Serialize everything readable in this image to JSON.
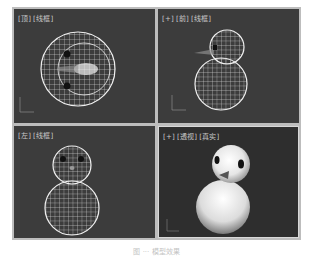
{
  "viewports": [
    {
      "id": "top",
      "labels": [
        "[顶]",
        "[线框]"
      ],
      "shading": "wireframe"
    },
    {
      "id": "front",
      "labels": [
        "[+]",
        "[前]",
        "[线框]"
      ],
      "shading": "wireframe"
    },
    {
      "id": "left",
      "labels": [
        "[左]",
        "[线框]"
      ],
      "shading": "wireframe"
    },
    {
      "id": "perspective",
      "labels": [
        "[+]",
        "[透视]",
        "[真实]"
      ],
      "shading": "realistic"
    }
  ],
  "axis_labels": {
    "y": "y",
    "x": "x"
  },
  "caption": "图 ··· 模型效果",
  "colors": {
    "viewport_bg": "#3c3c3c",
    "wire": "#e8e8e8",
    "label": "#c8c8c8",
    "frame": "#bdbdbd"
  }
}
